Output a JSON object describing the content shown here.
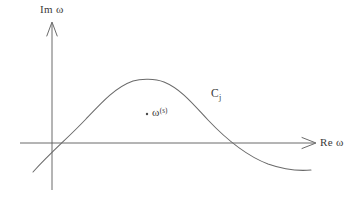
{
  "figure": {
    "background_color": "#ffffff",
    "ink_color": "#555555",
    "text_color": "#3a3a3a",
    "width": 355,
    "height": 200
  },
  "axes": {
    "vertical": {
      "label_prefix": "Im",
      "label_symbol": "ω",
      "label_full": "Im ω",
      "arrow": "up-arrowhead",
      "origin_x": 52,
      "top_y": 22,
      "bottom_y": 190
    },
    "horizontal": {
      "label_prefix": "Re",
      "label_symbol": "ω",
      "label_full": "Re ω",
      "arrow": "right-arrowhead",
      "origin_y": 143,
      "left_x": 20,
      "right_x": 316
    }
  },
  "contour": {
    "label_base": "C",
    "label_subscript": "j",
    "label_full": "Cⱼ",
    "description": "bell-shaped open contour rising from lower-left, peaking, descending to lower-right",
    "peak_x": 148,
    "peak_y": 80,
    "left_endpoint": [
      33,
      172
    ],
    "right_endpoint": [
      311,
      170
    ],
    "left_axis_crossing_x": 66,
    "right_axis_crossing_x": 262
  },
  "marked_point": {
    "dot_x": 147,
    "dot_y": 114,
    "label_base": "ω",
    "label_superscript": "(s)",
    "label_full": "ω⁽ˢ⁾"
  }
}
